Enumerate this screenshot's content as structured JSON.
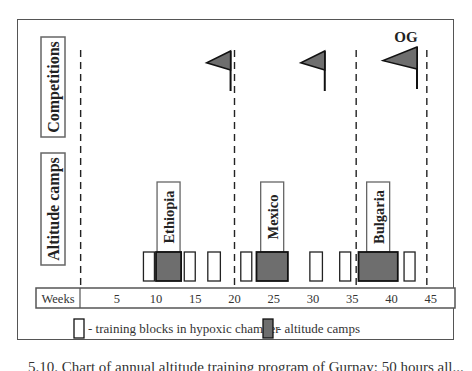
{
  "chart_data": {
    "type": "timeline",
    "xlabel": "Weeks",
    "x_ticks": [
      5,
      10,
      15,
      20,
      25,
      30,
      35,
      40,
      45
    ],
    "xlim": [
      0,
      48
    ],
    "rows": [
      {
        "id": "competitions",
        "label": "Competitions"
      },
      {
        "id": "altitude",
        "label": "Altitude camps"
      }
    ],
    "phase_dividers_weeks": [
      0.4,
      20,
      35.5,
      44.5
    ],
    "competitions": [
      {
        "week": 19.5,
        "label": ""
      },
      {
        "week": 31.5,
        "label": ""
      },
      {
        "week": 43.5,
        "label": "OG"
      }
    ],
    "altitude_camps": [
      {
        "name": "Ethiopia",
        "start_week": 10,
        "end_week": 13.2
      },
      {
        "name": "Mexico",
        "start_week": 22.8,
        "end_week": 26.8
      },
      {
        "name": "Bulgaria",
        "start_week": 35.8,
        "end_week": 40.8
      }
    ],
    "hypoxic_blocks": [
      {
        "start_week": 8.4,
        "end_week": 9.8
      },
      {
        "start_week": 13.6,
        "end_week": 15
      },
      {
        "start_week": 16.6,
        "end_week": 18.2
      },
      {
        "start_week": 20.8,
        "end_week": 22.2
      },
      {
        "start_week": 29.6,
        "end_week": 31.2
      },
      {
        "start_week": 33.4,
        "end_week": 34.8
      },
      {
        "start_week": 41.6,
        "end_week": 43
      }
    ],
    "legend": [
      {
        "key": "hypoxic",
        "label": "- training blocks in hypoxic chamber",
        "color": "#ffffff"
      },
      {
        "key": "altitude",
        "label": "- altitude camps",
        "color": "#6e6e6e"
      }
    ],
    "colors": {
      "altitude_fill": "#6e6e6e",
      "flag_fill": "#6e6e6e",
      "line": "#222222"
    }
  },
  "caption": "5.10. Chart of annual altitude training program of Gurnay; 50 hours all..."
}
